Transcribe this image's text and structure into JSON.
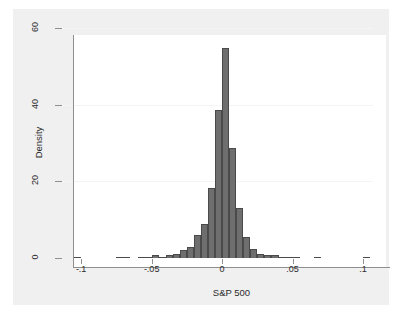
{
  "chart_data": {
    "type": "bar",
    "subtype": "histogram",
    "title": "",
    "subtitle": "",
    "xlabel": "S&P 500",
    "ylabel": "Density",
    "xlim": [
      -0.115,
      0.107
    ],
    "ylim": [
      0,
      60
    ],
    "xticks": [
      -0.1,
      -0.05,
      0,
      0.05,
      0.1
    ],
    "xtick_labels": [
      "-.1",
      "-.05",
      "0",
      ".05",
      ".1"
    ],
    "yticks": [
      0,
      20,
      40,
      60
    ],
    "ytick_labels": [
      "0",
      "20",
      "40",
      "60"
    ],
    "grid": "horizontal",
    "legend": "none",
    "bin_width": 0.005,
    "bar_color": "#6e6e6e",
    "bar_edge_color": "#4a4a4a",
    "plot_background": "#ffffff",
    "graph_background": "#f0f0f0",
    "axis_color": "#8f8f8f",
    "gridline_color": "#f4f4f4",
    "text_color": "#2b2b2b",
    "bins": [
      {
        "center": -0.1025,
        "value": 0.35
      },
      {
        "center": -0.0975,
        "value": 0.0
      },
      {
        "center": -0.0925,
        "value": 0.0
      },
      {
        "center": -0.0875,
        "value": 0.0
      },
      {
        "center": -0.0825,
        "value": 0.0
      },
      {
        "center": -0.0775,
        "value": 0.0
      },
      {
        "center": -0.0725,
        "value": 0.35
      },
      {
        "center": -0.0675,
        "value": 0.35
      },
      {
        "center": -0.0625,
        "value": 0.0
      },
      {
        "center": -0.0575,
        "value": 0.35
      },
      {
        "center": -0.0525,
        "value": 0.35
      },
      {
        "center": -0.0475,
        "value": 0.7
      },
      {
        "center": -0.0425,
        "value": 0.35
      },
      {
        "center": -0.0375,
        "value": 0.7
      },
      {
        "center": -0.0325,
        "value": 1.1
      },
      {
        "center": -0.0275,
        "value": 2.1
      },
      {
        "center": -0.0225,
        "value": 2.8
      },
      {
        "center": -0.0175,
        "value": 5.9
      },
      {
        "center": -0.0125,
        "value": 9.0
      },
      {
        "center": -0.0075,
        "value": 18.2
      },
      {
        "center": -0.0025,
        "value": 38.7
      },
      {
        "center": 0.0025,
        "value": 54.8
      },
      {
        "center": 0.0075,
        "value": 28.6
      },
      {
        "center": 0.0125,
        "value": 13.0
      },
      {
        "center": 0.0175,
        "value": 5.4
      },
      {
        "center": 0.0225,
        "value": 2.4
      },
      {
        "center": 0.0275,
        "value": 1.1
      },
      {
        "center": 0.0325,
        "value": 0.9
      },
      {
        "center": 0.0375,
        "value": 0.7
      },
      {
        "center": 0.0425,
        "value": 0.35
      },
      {
        "center": 0.0475,
        "value": 0.35
      },
      {
        "center": 0.0525,
        "value": 0.35
      },
      {
        "center": 0.0575,
        "value": 0.0
      },
      {
        "center": 0.0625,
        "value": 0.0
      },
      {
        "center": 0.0675,
        "value": 0.35
      },
      {
        "center": 0.0725,
        "value": 0.0
      },
      {
        "center": 0.0775,
        "value": 0.0
      },
      {
        "center": 0.0825,
        "value": 0.0
      },
      {
        "center": 0.0875,
        "value": 0.0
      },
      {
        "center": 0.0925,
        "value": 0.0
      },
      {
        "center": 0.0975,
        "value": 0.0
      },
      {
        "center": 0.1025,
        "value": 0.35
      }
    ]
  }
}
